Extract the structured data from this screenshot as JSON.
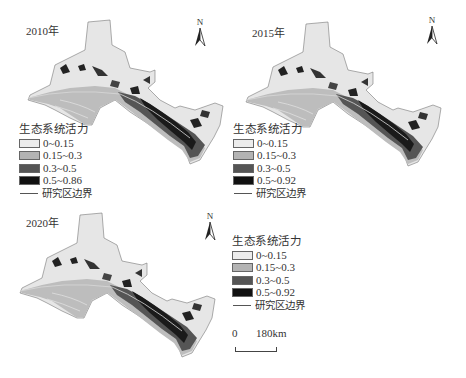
{
  "title": "生态系统活力",
  "panels": [
    {
      "year_label": "2010年",
      "north_label": "N",
      "legend": {
        "title": "生态系统活力",
        "items": [
          {
            "label": "0~0.15",
            "color": "#e8e8e8"
          },
          {
            "label": "0.15~0.3",
            "color": "#b8b8b8"
          },
          {
            "label": "0.3~0.5",
            "color": "#555555"
          },
          {
            "label": "0.5~0.86",
            "color": "#111111"
          }
        ],
        "boundary_label": "研究区边界"
      }
    },
    {
      "year_label": "2015年",
      "north_label": "N",
      "legend": {
        "title": "生态系统活力",
        "items": [
          {
            "label": "0~0.15",
            "color": "#e8e8e8"
          },
          {
            "label": "0.15~0.3",
            "color": "#b8b8b8"
          },
          {
            "label": "0.3~0.5",
            "color": "#555555"
          },
          {
            "label": "0.5~0.92",
            "color": "#111111"
          }
        ],
        "boundary_label": "研究区边界"
      }
    },
    {
      "year_label": "2020年",
      "north_label": "N",
      "legend": {
        "title": "生态系统活力",
        "items": [
          {
            "label": "0~0.15",
            "color": "#e8e8e8"
          },
          {
            "label": "0.15~0.3",
            "color": "#b8b8b8"
          },
          {
            "label": "0.3~0.5",
            "color": "#555555"
          },
          {
            "label": "0.5~0.92",
            "color": "#111111"
          }
        ],
        "boundary_label": "研究区边界"
      }
    }
  ],
  "scalebar": {
    "start": "0",
    "end": "180km"
  }
}
